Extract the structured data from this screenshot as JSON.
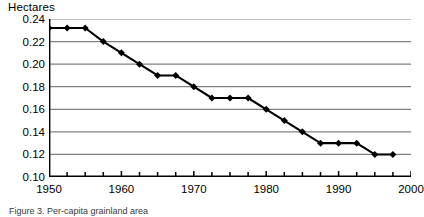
{
  "chart_data": {
    "type": "line",
    "title": "",
    "ylabel": "Hectares",
    "xlabel": "",
    "ylim": [
      0.1,
      0.24
    ],
    "xlim": [
      1950,
      2000
    ],
    "ytick_labels": [
      "0.24",
      "0.22",
      "0.20",
      "0.18",
      "0.16",
      "0.14",
      "0.12",
      "0.10"
    ],
    "ytick_values": [
      0.24,
      0.22,
      0.2,
      0.18,
      0.16,
      0.14,
      0.12,
      0.1
    ],
    "xtick_labels": [
      "1950",
      "1960",
      "1970",
      "1980",
      "1990",
      "2000"
    ],
    "xtick_values": [
      1950,
      1960,
      1970,
      1980,
      1990,
      2000
    ],
    "xminor_step": 2.5,
    "grid": "horizontal",
    "legend": "none",
    "marker": "diamond",
    "line_color": "#000000",
    "grid_color": "#808080",
    "x": [
      1950,
      1952.5,
      1955,
      1957.5,
      1960,
      1962.5,
      1965,
      1967.5,
      1970,
      1972.5,
      1975,
      1977.5,
      1980,
      1982.5,
      1985,
      1987.5,
      1990,
      1992.5,
      1995,
      1997.5
    ],
    "values": [
      0.232,
      0.232,
      0.232,
      0.22,
      0.21,
      0.2,
      0.19,
      0.19,
      0.18,
      0.17,
      0.17,
      0.17,
      0.16,
      0.15,
      0.14,
      0.13,
      0.13,
      0.13,
      0.12,
      0.12
    ],
    "series": [
      {
        "name": "Hectares",
        "values": [
          0.232,
          0.232,
          0.232,
          0.22,
          0.21,
          0.2,
          0.19,
          0.19,
          0.18,
          0.17,
          0.17,
          0.17,
          0.16,
          0.15,
          0.14,
          0.13,
          0.13,
          0.13,
          0.12,
          0.12
        ]
      }
    ]
  },
  "caption": {
    "text": "Figure 3. Per-capita grainland area"
  }
}
